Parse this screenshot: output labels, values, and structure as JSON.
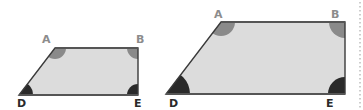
{
  "colors": {
    "fill": "#dcdcdc",
    "stroke": "#3a3a3a",
    "angle_light": "#8a8a8a",
    "angle_dark": "#2a2a2a",
    "label_light": "#8c8c8c",
    "label_dark": "#2a2a2a"
  },
  "shapes": [
    {
      "name": "small-trapezoid",
      "vertices": {
        "A": {
          "label": "A"
        },
        "B": {
          "label": "B"
        },
        "D": {
          "label": "D"
        },
        "E": {
          "label": "E"
        }
      }
    },
    {
      "name": "large-trapezoid",
      "vertices": {
        "A": {
          "label": "A"
        },
        "B": {
          "label": "B"
        },
        "D": {
          "label": "D"
        },
        "E": {
          "label": "E"
        }
      }
    }
  ]
}
